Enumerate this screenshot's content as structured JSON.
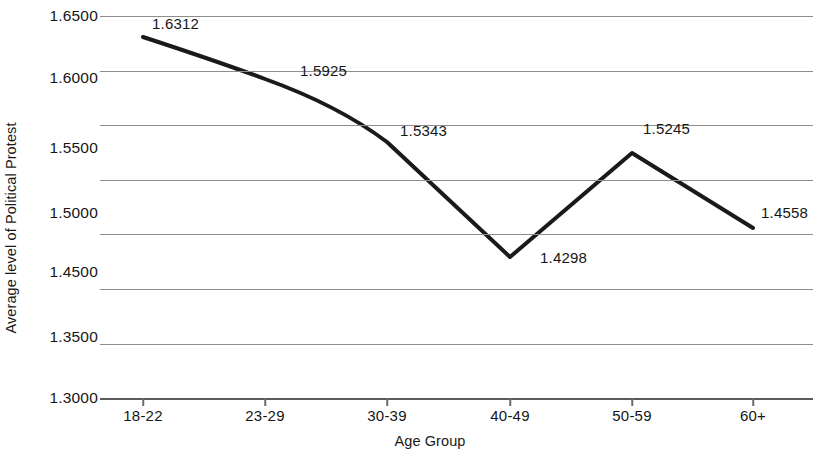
{
  "chart_data": {
    "type": "line",
    "title": "",
    "xlabel": "Age Group",
    "ylabel": "Average level of Political Protest",
    "categories": [
      "18-22",
      "23-29",
      "30-39",
      "40-49",
      "50-59",
      "60+"
    ],
    "values": [
      1.6312,
      1.5925,
      1.5343,
      1.4298,
      1.5245,
      1.4558
    ],
    "point_labels": [
      "1.6312",
      "1.5925",
      "1.5343",
      "1.4298",
      "1.5245",
      "1.4558"
    ],
    "series": [
      {
        "name": "Average level of Political Protest",
        "values": [
          1.6312,
          1.5925,
          1.5343,
          1.4298,
          1.5245,
          1.4558
        ]
      }
    ],
    "ylim": [
      1.3,
      1.65
    ],
    "ytick_values": [
      1.65,
      1.6,
      1.55,
      1.5,
      1.45,
      1.4,
      1.35,
      1.3
    ],
    "ytick_labels": [
      "1.6500",
      "1.6000",
      "1.5500",
      "1.5000",
      "1.4500",
      "",
      "1.3500",
      "1.3000"
    ],
    "grid": "horizontal",
    "legend": "none",
    "line_color": "#1a1a1a",
    "gridline_color": "#8d8d8d",
    "background_color": "#ffffff"
  },
  "axes": {
    "y_title": "Average level of Political Protest",
    "x_title": "Age Group"
  },
  "y_ticks": [
    {
      "label": "1.6500",
      "value": 1.65,
      "label_y": 16,
      "grid_y": 16,
      "axis": false
    },
    {
      "label": "1.6000",
      "value": 1.6,
      "label_y": 78,
      "grid_y": 71,
      "axis": false
    },
    {
      "label": "1.5500",
      "value": 1.55,
      "label_y": 148,
      "grid_y": 125,
      "axis": false
    },
    {
      "label": "1.5000",
      "value": 1.5,
      "label_y": 213,
      "grid_y": 180,
      "axis": false
    },
    {
      "label": "1.4500",
      "value": 1.45,
      "label_y": 272,
      "grid_y": 234,
      "axis": false
    },
    {
      "label": "",
      "value": 1.4,
      "label_y": -99,
      "grid_y": 289,
      "axis": false
    },
    {
      "label": "1.3500",
      "value": 1.35,
      "label_y": 337,
      "grid_y": 344,
      "axis": false
    },
    {
      "label": "1.3000",
      "value": 1.3,
      "label_y": 398,
      "grid_y": 398,
      "axis": true
    }
  ],
  "x_ticks": [
    {
      "label": "18-22",
      "x": 43
    },
    {
      "label": "23-29",
      "x": 165
    },
    {
      "label": "30-39",
      "x": 287
    },
    {
      "label": "40-49",
      "x": 410
    },
    {
      "label": "50-59",
      "x": 532
    },
    {
      "label": "60+",
      "x": 653
    }
  ],
  "points": [
    {
      "label": "1.6312",
      "x": 43,
      "y": 37,
      "label_x": 52,
      "label_y": 15
    },
    {
      "label": "1.5925",
      "x": 165,
      "y": 79,
      "label_x": 200,
      "label_y": 62
    },
    {
      "label": "1.5343",
      "x": 287,
      "y": 142,
      "label_x": 300,
      "label_y": 122
    },
    {
      "label": "1.4298",
      "x": 410,
      "y": 257,
      "label_x": 440,
      "label_y": 249
    },
    {
      "label": "1.5245",
      "x": 532,
      "y": 153,
      "label_x": 543,
      "label_y": 120
    },
    {
      "label": "1.4558",
      "x": 653,
      "y": 228,
      "label_x": 661,
      "label_y": 204
    }
  ],
  "line_path": "M 43 37 C 95 54, 130 66, 165 79 C 215 97, 255 118, 287 142 L 410 257 L 532 153 L 653 228"
}
